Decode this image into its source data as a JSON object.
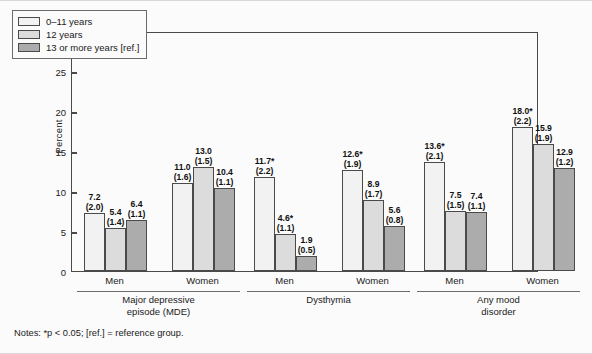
{
  "figure": {
    "notes": "Notes: *p < 0.05; [ref.] = reference group."
  },
  "chart_data": {
    "type": "bar",
    "title": "",
    "xlabel": "",
    "ylabel": "Percent",
    "ylim": [
      0,
      30
    ],
    "yticks": [
      0,
      5,
      10,
      15,
      20,
      25,
      30
    ],
    "grid": false,
    "legend_position": "top-left",
    "legend": [
      "0–11 years",
      "12 years",
      "13 or more years [ref.]"
    ],
    "series": [
      {
        "name": "0–11 years",
        "values": [
          7.2,
          11.0,
          11.7,
          12.6,
          13.6,
          18.0
        ],
        "labels": [
          "7.2",
          "11.0",
          "11.7*",
          "12.6*",
          "13.6*",
          "18.0*"
        ],
        "errors": [
          "(2.0)",
          "(1.6)",
          "(2.2)",
          "(1.9)",
          "(2.1)",
          "(2.2)"
        ]
      },
      {
        "name": "12 years",
        "values": [
          5.4,
          13.0,
          4.6,
          8.9,
          7.5,
          15.9
        ],
        "labels": [
          "5.4",
          "13.0",
          "4.6*",
          "8.9",
          "7.5",
          "15.9"
        ],
        "errors": [
          "(1.4)",
          "(1.5)",
          "(1.1)",
          "(1.7)",
          "(1.5)",
          "(1.9)"
        ]
      },
      {
        "name": "13 or more years [ref.]",
        "values": [
          6.4,
          10.4,
          1.9,
          5.6,
          7.4,
          12.9
        ],
        "labels": [
          "6.4",
          "10.4",
          "1.9",
          "5.6",
          "7.4",
          "12.9"
        ],
        "errors": [
          "(1.1)",
          "(1.1)",
          "(0.5)",
          "(0.8)",
          "(1.1)",
          "(1.2)"
        ]
      }
    ],
    "categories": [
      "Men",
      "Women",
      "Men",
      "Women",
      "Men",
      "Women"
    ],
    "groups": [
      {
        "label": "Major depressive\nepisode (MDE)",
        "categories": [
          "Men",
          "Women"
        ]
      },
      {
        "label": "Dysthymia",
        "categories": [
          "Men",
          "Women"
        ]
      },
      {
        "label": "Any mood\ndisorder",
        "categories": [
          "Men",
          "Women"
        ]
      }
    ],
    "colors": {
      "series_0": "#f2f2f2",
      "series_1": "#dcdcdc",
      "series_2": "#acacac",
      "outline": "#4a4a4a",
      "background": "#fbfbfb"
    }
  }
}
